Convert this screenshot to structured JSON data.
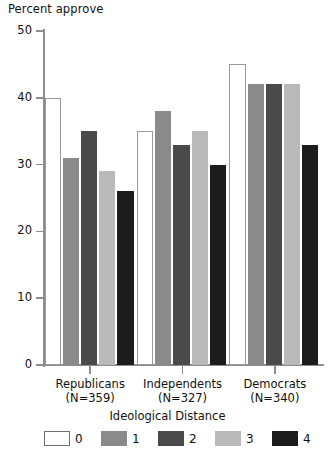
{
  "chart_data": {
    "type": "bar",
    "title": "",
    "ylabel": "Percent approve",
    "xlabel": "",
    "ylim": [
      0,
      50
    ],
    "yticks": [
      0,
      10,
      20,
      30,
      40,
      50
    ],
    "grid": false,
    "legend_position": "bottom",
    "legend_title": "Ideological Distance",
    "categories": [
      "Republicans",
      "Independents",
      "Democrats"
    ],
    "category_sublabels": [
      "(N=359)",
      "(N=327)",
      "(N=340)"
    ],
    "series": [
      {
        "name": "0",
        "color": "#ffffff",
        "values": [
          40,
          35,
          45
        ]
      },
      {
        "name": "1",
        "color": "#8a8a8a",
        "values": [
          31,
          38,
          42
        ]
      },
      {
        "name": "2",
        "color": "#4a4a4a",
        "values": [
          35,
          33,
          42
        ]
      },
      {
        "name": "3",
        "color": "#b9b9b9",
        "values": [
          29,
          35,
          42
        ]
      },
      {
        "name": "4",
        "color": "#1c1c1c",
        "values": [
          26,
          30,
          33
        ]
      }
    ]
  },
  "axis": {
    "y_title": "Percent approve",
    "tick_labels": [
      "50",
      "40",
      "30",
      "20",
      "10",
      "0"
    ]
  },
  "legend": {
    "title": "Ideological Distance",
    "items": [
      {
        "label": "0",
        "swatch": "swatch-white"
      },
      {
        "label": "1",
        "swatch": "swatch-medium-gray"
      },
      {
        "label": "2",
        "swatch": "swatch-dark-gray"
      },
      {
        "label": "3",
        "swatch": "swatch-light-gray"
      },
      {
        "label": "4",
        "swatch": "swatch-black"
      }
    ]
  },
  "groups": [
    {
      "name": "Republicans",
      "n": "(N=359)"
    },
    {
      "name": "Independents",
      "n": "(N=327)"
    },
    {
      "name": "Democrats",
      "n": "(N=340)"
    }
  ]
}
